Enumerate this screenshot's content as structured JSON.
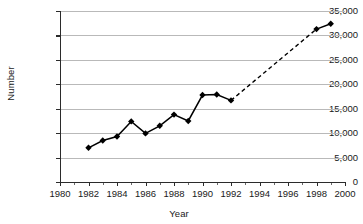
{
  "chart_data": {
    "type": "line",
    "title": "",
    "xlabel": "Year",
    "ylabel": "Number",
    "xlim": [
      1980,
      2000
    ],
    "ylim": [
      0,
      35000
    ],
    "grid": true,
    "legend": "none",
    "x_tick_labels": [
      "1980",
      "1982",
      "1984",
      "1986",
      "1988",
      "1990",
      "1992",
      "1994",
      "1996",
      "1998",
      "2000"
    ],
    "x_tick_values": [
      1980,
      1982,
      1984,
      1986,
      1988,
      1990,
      1992,
      1994,
      1996,
      1998,
      2000
    ],
    "x_minor_tick_values": [
      1981,
      1983,
      1985,
      1987,
      1989,
      1991,
      1993,
      1995,
      1997,
      1999
    ],
    "y_tick_labels": [
      "0",
      "5,000",
      "10,000",
      "15,000",
      "20,000",
      "25,000",
      "30,000",
      "35,000"
    ],
    "y_tick_values": [
      0,
      5000,
      10000,
      15000,
      20000,
      25000,
      30000,
      35000
    ],
    "series": [
      {
        "name": "observed",
        "line_style": "solid",
        "marker": "diamond",
        "x": [
          1982,
          1983,
          1984,
          1985,
          1986,
          1987,
          1988,
          1989,
          1990,
          1991,
          1992
        ],
        "values": [
          7000,
          8500,
          9300,
          12400,
          9950,
          11500,
          13800,
          12500,
          17800,
          17900,
          16700
        ]
      },
      {
        "name": "projected-gap",
        "line_style": "dashed",
        "marker": "none",
        "x": [
          1992,
          1998
        ],
        "values": [
          16700,
          31300
        ]
      },
      {
        "name": "later-observed",
        "line_style": "solid",
        "marker": "diamond",
        "x": [
          1998,
          1999
        ],
        "values": [
          31300,
          32400
        ]
      }
    ],
    "colors": {
      "line": "#000000",
      "marker": "#000000",
      "grid": "#b9b9b9",
      "axis": "#2b2b2b",
      "background": "#ffffff"
    }
  }
}
